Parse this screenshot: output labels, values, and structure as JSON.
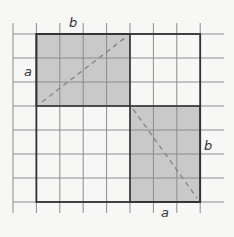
{
  "diagram": {
    "grid": {
      "columns": 9,
      "rows": 8,
      "cell_size": 23.4,
      "line_color": "#8a8a8a"
    },
    "outer_square": {
      "border_color": "#333333",
      "cells_wide": 7,
      "cells_high": 7
    },
    "rect_top_left": {
      "width_label": "b",
      "height_label": "a",
      "cells_wide": 4,
      "cells_high": 3,
      "fill": "#c8c8c8"
    },
    "rect_bottom_right": {
      "width_label": "a",
      "height_label": "b",
      "cells_wide": 3,
      "cells_high": 4,
      "fill": "#c8c8c8"
    },
    "diagonal_style": "dashed",
    "diagonal_color": "#888888"
  },
  "labels": {
    "top_b": "b",
    "left_a": "a",
    "right_b": "b",
    "bottom_a": "a"
  }
}
